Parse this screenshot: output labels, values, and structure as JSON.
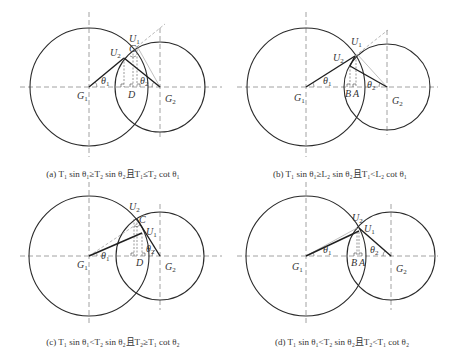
{
  "figure": {
    "panels": [
      {
        "id": "a",
        "caption": "(a) T₁ sin θ₁≥T₂ sin θ₂且T₁≤T₂ cot θ₁",
        "labels": {
          "G1": "G₁",
          "G2": "G₂",
          "U1": "U₁",
          "U2": "U₂",
          "C": "C",
          "D": "D",
          "theta1": "θ₁",
          "theta2": "θ₂"
        }
      },
      {
        "id": "b",
        "caption": "(b) T₁ sin θ₁≥L₂ sin θ₂且T₁<L₂ cot θ₁",
        "labels": {
          "G1": "G₁",
          "G2": "G₂",
          "U1": "U₁",
          "U2": "U₂",
          "A": "A",
          "B": "B",
          "theta1": "θ₁",
          "theta2": "θ₂"
        }
      },
      {
        "id": "c",
        "caption": "(c) T₁ sin θ₁<T₂ sin θ₂且T₂≥T₁ cot θ₂",
        "labels": {
          "G1": "G₁",
          "G2": "G₂",
          "U1": "U₁",
          "U2": "U₂",
          "C": "C",
          "D": "D",
          "theta1": "θ₁",
          "theta2": "θ₂"
        }
      },
      {
        "id": "d",
        "caption": "(d) T₁ sin θ₁<T₂ sin θ₂且T₂<T₁ cot θ₂",
        "labels": {
          "G1": "G₁",
          "G2": "G₂",
          "U1": "U₁",
          "U2": "U₂",
          "A": "A",
          "B": "B",
          "theta1": "θ₁",
          "theta2": "θ₂"
        }
      }
    ]
  }
}
